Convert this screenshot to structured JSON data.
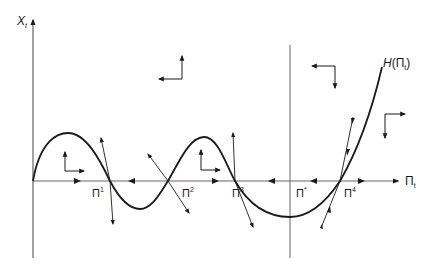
{
  "diagram": {
    "type": "phase-diagram",
    "axes": {
      "y_label": "X",
      "y_label_sub": "t",
      "x_label": "Π",
      "x_label_sub": "t"
    },
    "curve": {
      "label_main": "H",
      "label_arg": "(Π",
      "label_arg_sub": "t",
      "label_close": ")"
    },
    "equilibria": [
      {
        "id": "pi1",
        "base": "Π",
        "sup": "1",
        "stability": "saddle"
      },
      {
        "id": "pi2",
        "base": "Π",
        "sup": "2",
        "stability": "saddle"
      },
      {
        "id": "pi3",
        "base": "Π",
        "sup": "3",
        "stability": "saddle"
      },
      {
        "id": "pi-star",
        "base": "Π",
        "sup": "*",
        "stability": "target"
      },
      {
        "id": "pi4",
        "base": "Π",
        "sup": "4",
        "stability": "saddle"
      }
    ],
    "colors": {
      "line": "#1a1a1a",
      "axis": "#555555",
      "background": "#ffffff"
    }
  }
}
